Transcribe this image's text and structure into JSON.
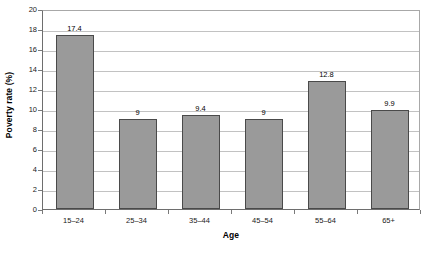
{
  "chart_data": {
    "type": "bar",
    "title": "",
    "xlabel": "Age",
    "ylabel": "Poverty rate (%)",
    "categories": [
      "15–24",
      "25–34",
      "35–44",
      "45–54",
      "55–64",
      "65+"
    ],
    "values": [
      17.4,
      9,
      9.4,
      9,
      12.8,
      9.9
    ],
    "value_labels": [
      "17.4",
      "9",
      "9.4",
      "9",
      "12.8",
      "9.9"
    ],
    "ylim": [
      0,
      20
    ],
    "ytick_step": 2,
    "yticks": [
      20,
      18,
      16,
      14,
      12,
      10,
      8,
      6,
      4,
      2,
      0
    ],
    "ytick_labels": [
      "20",
      "18",
      "16",
      "14",
      "12",
      "10",
      "8",
      "6",
      "4",
      "2",
      "0"
    ],
    "grid": true,
    "grid_axis": "y",
    "legend": false,
    "legend_position": "none",
    "series": [
      {
        "name": "Poverty rate",
        "values": [
          17.4,
          9,
          9.4,
          9,
          12.8,
          9.9
        ],
        "color": "#9a9a9a",
        "border_color": "#4a4a4a"
      }
    ]
  },
  "colors": {
    "bar_fill": "#9a9a9a",
    "bar_border": "#4a4a4a",
    "gridline": "#c2c2c2",
    "axis_line": "#6e6e6e",
    "plot_border": "#a8a8a8",
    "text": "#000000",
    "background": "#ffffff"
  },
  "artifact": {
    "bottom_strip_text": ""
  }
}
